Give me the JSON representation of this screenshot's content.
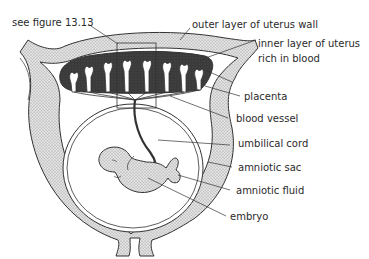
{
  "figure": {
    "type": "labelled anatomical diagram"
  },
  "labels": {
    "see_figure": "see figure 13.13",
    "outer_layer": "outer layer of uterus wall",
    "inner_layer_1": "inner layer of uterus",
    "inner_layer_2": "rich in blood",
    "placenta": "placenta",
    "blood_vessel": "blood vessel",
    "umbilical_cord": "umbilical cord",
    "amniotic_sac": "amniotic sac",
    "amniotic_fluid": "amniotic fluid",
    "embryo": "embryo"
  },
  "colors": {
    "uterus_wall_fill": "#d4d4d4",
    "placenta_fill": "#3a3a3a",
    "embryo_fill": "#d8d8d8",
    "line": "#333333",
    "text": "#2a2a2a"
  }
}
